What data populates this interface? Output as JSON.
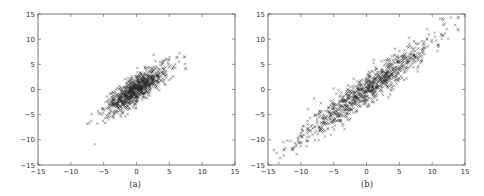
{
  "chart_data": [
    {
      "type": "scatter",
      "title": "",
      "caption": "(a)",
      "xlabel": "",
      "ylabel": "",
      "xlim": [
        -15,
        15
      ],
      "ylim": [
        -15,
        15
      ],
      "xticks": [
        -15,
        -10,
        -5,
        0,
        5,
        10,
        15
      ],
      "yticks": [
        -15,
        -10,
        -5,
        0,
        5,
        10,
        15
      ],
      "grid": false,
      "marker": "x",
      "marker_color": "#222222",
      "distribution": {
        "n": 900,
        "mean": [
          0,
          0
        ],
        "std": [
          2.4,
          2.4
        ],
        "correlation": 0.82,
        "seed": 7
      },
      "notable_points": [
        [
          -6.3,
          -10.9
        ],
        [
          -7.5,
          -6.8
        ],
        [
          7.2,
          6.4
        ],
        [
          2.6,
          6.9
        ]
      ]
    },
    {
      "type": "scatter",
      "title": "",
      "caption": "(b)",
      "xlabel": "",
      "ylabel": "",
      "xlim": [
        -15,
        15
      ],
      "ylim": [
        -15,
        15
      ],
      "xticks": [
        -15,
        -10,
        -5,
        0,
        5,
        10,
        15
      ],
      "yticks": [
        -15,
        -10,
        -5,
        0,
        5,
        10,
        15
      ],
      "grid": false,
      "marker": "x",
      "marker_color": "#222222",
      "distribution": {
        "n": 1000,
        "mean": [
          0,
          0
        ],
        "std": [
          5.0,
          5.0
        ],
        "correlation": 0.95,
        "seed": 11
      },
      "notable_points": [
        [
          14,
          14.3
        ],
        [
          13.5,
          12.8
        ],
        [
          -13.7,
          -12.6
        ],
        [
          -5,
          0.2
        ],
        [
          11.2,
          14
        ]
      ]
    }
  ]
}
